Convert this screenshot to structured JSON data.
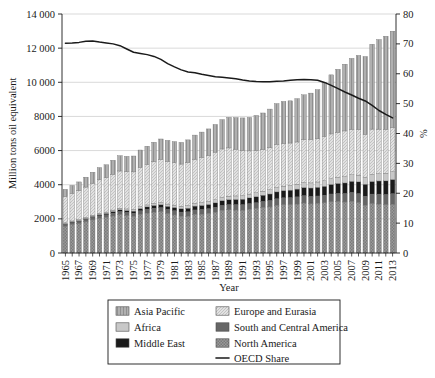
{
  "chart_data": {
    "type": "bar",
    "subtype": "stacked-bar-with-line",
    "title": "",
    "xlabel": "Year",
    "ylabel": "Million tons oil equivalent",
    "y2label": "%",
    "ylim": [
      0,
      14000
    ],
    "y2lim": [
      0,
      80
    ],
    "yticks": [
      0,
      2000,
      4000,
      6000,
      8000,
      10000,
      12000,
      14000
    ],
    "ytick_labels": [
      "0",
      "2000",
      "4000",
      "6000",
      "8000",
      "10 000",
      "12 000",
      "14 000"
    ],
    "y2ticks": [
      0,
      10,
      20,
      30,
      40,
      50,
      60,
      70,
      80
    ],
    "y2tick_labels": [
      "0",
      "10",
      "20",
      "30",
      "40",
      "50",
      "60",
      "70",
      "80"
    ],
    "grid": true,
    "legend_position": "bottom",
    "x": [
      1965,
      1966,
      1967,
      1968,
      1969,
      1970,
      1971,
      1972,
      1973,
      1974,
      1975,
      1976,
      1977,
      1978,
      1979,
      1980,
      1981,
      1982,
      1983,
      1984,
      1985,
      1986,
      1987,
      1988,
      1989,
      1990,
      1991,
      1992,
      1993,
      1994,
      1995,
      1996,
      1997,
      1998,
      1999,
      2000,
      2001,
      2002,
      2003,
      2004,
      2005,
      2006,
      2007,
      2008,
      2009,
      2010,
      2011,
      2012,
      2013
    ],
    "xtick_labels": [
      "1965",
      "1967",
      "1969",
      "1971",
      "1973",
      "1975",
      "1977",
      "1979",
      "1981",
      "1983",
      "1985",
      "1987",
      "1989",
      "1991",
      "1993",
      "1995",
      "1997",
      "1999",
      "2001",
      "2003",
      "2005",
      "2007",
      "2009",
      "2011",
      "2013"
    ],
    "series": [
      {
        "name": "North America",
        "color": "#8f8f8f",
        "pattern": "checker",
        "values": [
          1570,
          1660,
          1720,
          1830,
          1940,
          2030,
          2080,
          2170,
          2250,
          2190,
          2140,
          2270,
          2340,
          2400,
          2420,
          2310,
          2230,
          2150,
          2160,
          2260,
          2280,
          2320,
          2390,
          2490,
          2530,
          2520,
          2510,
          2560,
          2600,
          2660,
          2700,
          2790,
          2830,
          2830,
          2870,
          2930,
          2880,
          2910,
          2940,
          3000,
          3010,
          2990,
          3030,
          2950,
          2800,
          2890,
          2870,
          2830,
          2860
        ]
      },
      {
        "name": "South and Central America",
        "color": "#666666",
        "pattern": "solid",
        "values": [
          110,
          118,
          125,
          133,
          141,
          150,
          158,
          168,
          180,
          186,
          192,
          203,
          215,
          227,
          238,
          243,
          246,
          247,
          252,
          262,
          268,
          273,
          283,
          294,
          304,
          312,
          321,
          333,
          344,
          357,
          372,
          387,
          404,
          413,
          417,
          427,
          430,
          430,
          438,
          457,
          474,
          492,
          514,
          530,
          522,
          561,
          579,
          595,
          613
        ]
      },
      {
        "name": "Middle East",
        "color": "#1a1a1a",
        "pattern": "solid",
        "values": [
          42,
          47,
          52,
          58,
          65,
          73,
          82,
          92,
          103,
          111,
          120,
          133,
          147,
          160,
          173,
          181,
          190,
          199,
          212,
          226,
          239,
          251,
          264,
          280,
          293,
          306,
          320,
          338,
          354,
          369,
          384,
          402,
          420,
          438,
          456,
          478,
          496,
          510,
          530,
          560,
          593,
          622,
          654,
          688,
          706,
          738,
          770,
          800,
          832
        ]
      },
      {
        "name": "Africa",
        "color": "#c8c8c8",
        "pattern": "solid",
        "values": [
          48,
          52,
          56,
          61,
          66,
          72,
          77,
          83,
          90,
          95,
          100,
          107,
          114,
          121,
          128,
          134,
          140,
          145,
          152,
          159,
          167,
          174,
          182,
          190,
          198,
          205,
          212,
          220,
          228,
          236,
          245,
          254,
          263,
          272,
          281,
          291,
          300,
          310,
          322,
          338,
          353,
          366,
          382,
          396,
          402,
          420,
          427,
          443,
          459
        ]
      },
      {
        "name": "Europe and Eurasia",
        "color": "#dcdcdc",
        "pattern": "hatch",
        "values": [
          1530,
          1610,
          1690,
          1780,
          1880,
          1960,
          2010,
          2100,
          2180,
          2180,
          2200,
          2310,
          2370,
          2440,
          2520,
          2500,
          2480,
          2470,
          2520,
          2590,
          2650,
          2710,
          2790,
          2840,
          2830,
          2740,
          2650,
          2530,
          2480,
          2430,
          2460,
          2540,
          2500,
          2490,
          2480,
          2510,
          2540,
          2530,
          2590,
          2620,
          2640,
          2680,
          2660,
          2670,
          2520,
          2650,
          2610,
          2580,
          2580
        ]
      },
      {
        "name": "Asia Pacific",
        "color": "#a8a8a8",
        "pattern": "vgrid",
        "values": [
          430,
          470,
          520,
          580,
          640,
          720,
          760,
          820,
          900,
          900,
          930,
          1010,
          1070,
          1140,
          1200,
          1230,
          1240,
          1270,
          1330,
          1410,
          1480,
          1540,
          1620,
          1720,
          1790,
          1850,
          1900,
          1960,
          2050,
          2150,
          2270,
          2380,
          2460,
          2470,
          2540,
          2630,
          2720,
          2880,
          3160,
          3460,
          3690,
          3910,
          4160,
          4340,
          4560,
          4970,
          5250,
          5450,
          5650
        ]
      }
    ],
    "line_series": {
      "name": "OECD Share",
      "color": "#1a1a1a",
      "axis": "right",
      "unit": "%",
      "values": [
        70.2,
        70.3,
        70.5,
        70.9,
        71.0,
        70.6,
        70.3,
        70.0,
        69.4,
        68.3,
        67.2,
        66.8,
        66.4,
        65.8,
        64.8,
        63.4,
        62.3,
        61.3,
        60.6,
        60.3,
        59.8,
        59.4,
        59.0,
        58.8,
        58.6,
        58.3,
        57.9,
        57.6,
        57.4,
        57.3,
        57.3,
        57.5,
        57.6,
        57.8,
        58.0,
        58.1,
        58.0,
        57.8,
        57.1,
        56.1,
        55.0,
        53.9,
        52.9,
        51.8,
        50.9,
        49.4,
        47.7,
        46.4,
        45.2
      ]
    }
  },
  "legend": {
    "entries": [
      {
        "label": "Asia Pacific",
        "swatch": "asia-pacific"
      },
      {
        "label": "Europe and Eurasia",
        "swatch": "europe-eurasia"
      },
      {
        "label": "Africa",
        "swatch": "africa"
      },
      {
        "label": "South and Central America",
        "swatch": "south-central-america"
      },
      {
        "label": "Middle East",
        "swatch": "middle-east"
      },
      {
        "label": "North America",
        "swatch": "north-america"
      },
      {
        "label": "OECD Share",
        "swatch": "oecd-share-line"
      }
    ]
  }
}
